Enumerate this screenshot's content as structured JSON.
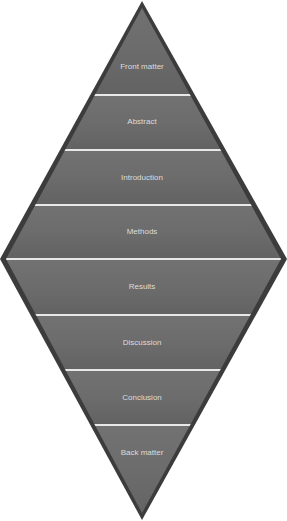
{
  "diagram": {
    "type": "diamond",
    "colors": {
      "outline": "#3c3c3c",
      "fill": "#6a6a6a",
      "fill_light": "#767676",
      "divider": "#e8e8e8",
      "label": "#dcdcdc"
    },
    "sections": [
      {
        "label": "Front matter"
      },
      {
        "label": "Abstract"
      },
      {
        "label": "Introduction"
      },
      {
        "label": "Methods"
      },
      {
        "label": "Results"
      },
      {
        "label": "Discussion"
      },
      {
        "label": "Conclusion"
      },
      {
        "label": "Back matter"
      }
    ]
  }
}
